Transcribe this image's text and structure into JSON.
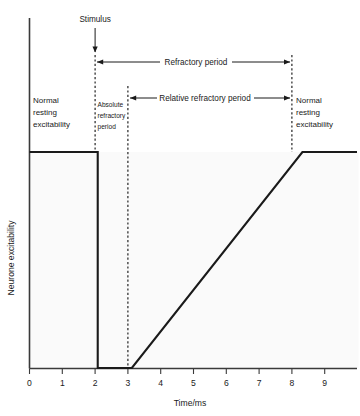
{
  "chart_data": {
    "type": "line",
    "title": "",
    "subtitle": "",
    "xlabel": "Time/ms",
    "ylabel": "Neurone excitability",
    "xlim": [
      0,
      9.6
    ],
    "ylim": [
      0,
      1.17
    ],
    "grid": false,
    "legend": "none",
    "x_ticks": [
      "0",
      "1",
      "2",
      "3",
      "4",
      "5",
      "6",
      "7",
      "8",
      "9"
    ],
    "x_tick_values": [
      0,
      1,
      2,
      3,
      4,
      5,
      6,
      7,
      8,
      9
    ],
    "y_ticks": [],
    "series": [
      {
        "name": "Neurone excitability",
        "x": [
          0,
          2,
          2,
          3,
          8,
          9.6
        ],
        "values": [
          1,
          1,
          0,
          0,
          1,
          1
        ],
        "description": "Normal resting excitability until stimulus at 2 ms, falls to zero during absolute refractory period (2-3 ms), recovers linearly during relative refractory period (3-8 ms), then returns to normal resting excitability"
      }
    ],
    "annotations": [
      {
        "name": "stimulus",
        "label": "Stimulus",
        "type": "arrow-down",
        "x": 2,
        "note": "vertical arrow pointing down to the 2 ms marker"
      },
      {
        "name": "refractory-period",
        "label": "Refractory period",
        "type": "double-arrow",
        "x_start": 2,
        "x_end": 8
      },
      {
        "name": "relative-refractory-period",
        "label": "Relative refractory period",
        "type": "double-arrow",
        "x_start": 3,
        "x_end": 8
      },
      {
        "name": "absolute-refractory-period",
        "label": "Absolute refractory period",
        "lines": [
          "Absolute",
          "refractory",
          "period"
        ],
        "type": "text-block",
        "x_start": 2,
        "x_end": 3
      },
      {
        "name": "normal-resting-excitability-left",
        "label": "Normal resting excitability",
        "lines": [
          "Normal",
          "resting",
          "excitability"
        ],
        "type": "text-block",
        "x_start": 0,
        "x_end": 2
      },
      {
        "name": "normal-resting-excitability-right",
        "label": "Normal resting excitability",
        "lines": [
          "Normal",
          "resting",
          "excitability"
        ],
        "type": "text-block",
        "x_start": 8,
        "x_end": 9.6
      }
    ],
    "markers": {
      "dashed_verticals": [
        2,
        3,
        8
      ]
    }
  },
  "colors": {
    "curve": "#1a1a1a",
    "axis": "#3a3a3a",
    "plot_background": "#fafafa",
    "page_background": "#ffffff",
    "text": "#1a1a1a"
  }
}
